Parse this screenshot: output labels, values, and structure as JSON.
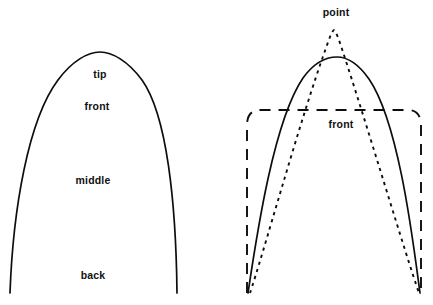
{
  "figure": {
    "width": 433,
    "height": 305,
    "background_color": "#ffffff",
    "stroke_color": "#0d0d0d"
  },
  "panels": [
    {
      "id": "left-panel",
      "name": "left-outline-diagram",
      "description": "Single solid parabolic blade outline divided into named zones",
      "labels": [
        {
          "name": "label-tip",
          "text": "tip",
          "x": 100,
          "y": 74
        },
        {
          "name": "label-front",
          "text": "front",
          "x": 97,
          "y": 106
        },
        {
          "name": "label-middle",
          "text": "middle",
          "x": 93,
          "y": 180
        },
        {
          "name": "label-back",
          "text": "back",
          "x": 93,
          "y": 275
        }
      ],
      "curves": [
        {
          "name": "solid-blade-outline",
          "style": "solid",
          "path": "M 10 293 C 13 210 28 120 58 80 C 72 61 88 52 100 52 C 112 52 128 61 142 80 C 167 115 176 203 177 293"
        }
      ]
    },
    {
      "id": "right-panel",
      "name": "right-overlay-diagram",
      "description": "Three superimposed outlines: solid rounded blade, dotted pointed blade, long-dashed squared blade",
      "labels": [
        {
          "name": "label-point",
          "text": "point",
          "x": 336,
          "y": 12
        },
        {
          "name": "label-front",
          "text": "front",
          "x": 341,
          "y": 124
        }
      ],
      "curves": [
        {
          "name": "dotted-pointed-outline",
          "style": "dotted",
          "path": "M 250 293 C 262 258 300 120 326 48 C 329 39 332 31 334 30 C 336 31 339 40 342 49 C 366 122 407 259 419 293"
        },
        {
          "name": "solid-rounded-outline",
          "style": "solid",
          "path": "M 248 293 C 256 240 273 122 303 78 C 316 60 329 57 337 57 C 345 57 357 62 369 79 C 399 123 413 241 420 293"
        },
        {
          "name": "dashed-squared-outline",
          "style": "dashed",
          "path": "M 247 293 L 247 125 C 247 116 251 110 260 110 L 408 110 C 417 110 421 116 421 125 L 421 293"
        }
      ]
    }
  ]
}
